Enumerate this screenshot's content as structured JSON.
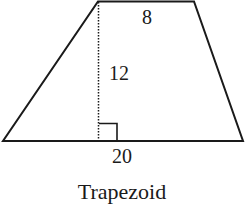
{
  "figure": {
    "caption": "Trapezoid",
    "shape": "trapezoid",
    "labels": {
      "top_base": "8",
      "height": "12",
      "bottom_base": "20"
    },
    "right_angle_marker": true,
    "colors": {
      "stroke": "#1a1a1a",
      "background": "#ffffff"
    }
  }
}
